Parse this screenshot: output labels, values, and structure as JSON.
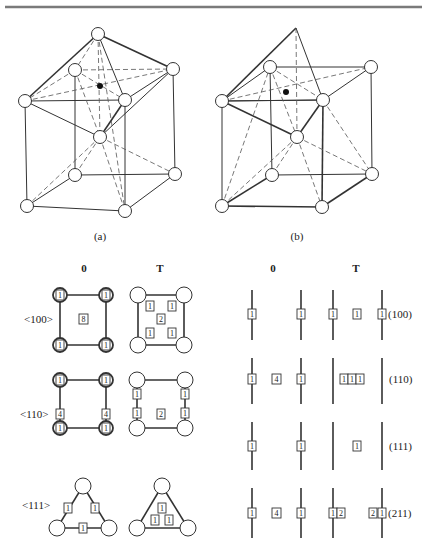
{
  "figure": {
    "top_rule_color": "#7a7a7a",
    "panels": [
      {
        "id": "a",
        "caption": "(a)"
      },
      {
        "id": "b",
        "caption": "(b)"
      }
    ],
    "left_table": {
      "headers": [
        "0",
        "T"
      ],
      "rows": [
        {
          "direction": "<100>",
          "O": {
            "corners": [
              "1",
              "1",
              "1",
              "1"
            ],
            "center": "8"
          },
          "T": {
            "inner": [
              "1",
              "1",
              "2",
              "1",
              "1"
            ]
          }
        },
        {
          "direction": "<110>",
          "O": {
            "corners": [
              "1",
              "1",
              "1",
              "1"
            ],
            "edges": [
              "4",
              "4"
            ]
          },
          "T": {
            "edges": [
              "1",
              "1",
              "1",
              "1"
            ],
            "center": "2"
          }
        },
        {
          "direction": "<111>",
          "O": {
            "edges": [
              "1",
              "1",
              "1"
            ]
          },
          "T": {
            "inner": [
              "1",
              "1",
              "1"
            ]
          }
        }
      ]
    },
    "right_table": {
      "headers": [
        "0",
        "T"
      ],
      "rows": [
        {
          "plane": "(100)",
          "O": [
            "1",
            "1"
          ],
          "T": [
            "1",
            "1",
            "1"
          ]
        },
        {
          "plane": "(110)",
          "O": [
            "1",
            "4",
            "1"
          ],
          "T": [
            "1",
            "1",
            "1"
          ]
        },
        {
          "plane": "(111)",
          "O": [
            "1",
            "1"
          ],
          "T": [
            "1"
          ]
        },
        {
          "plane": "(211)",
          "O": [
            "1",
            "4",
            "1"
          ],
          "T": [
            "1",
            "2",
            "2",
            "1"
          ]
        }
      ]
    }
  }
}
